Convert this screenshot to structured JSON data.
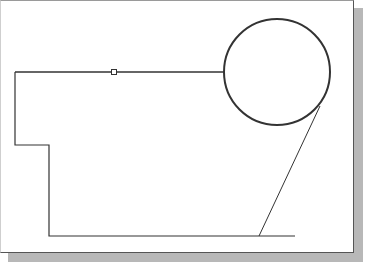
{
  "canvas": {
    "width": 365,
    "height": 262,
    "background": "#ffffff",
    "sheet_border_color": "#555555",
    "shadow_color": "#b8b8b8"
  },
  "sketch": {
    "stroke_color": "#333333",
    "profile_points": [
      [
        15,
        72
      ],
      [
        15,
        145
      ],
      [
        49,
        145
      ],
      [
        49,
        236
      ],
      [
        295,
        236
      ]
    ],
    "top_line": {
      "x1": 15,
      "y1": 72,
      "x2": 224,
      "y2": 72
    },
    "midpoint_marker": {
      "x": 114,
      "y": 72,
      "size": 5
    },
    "circle": {
      "cx": 277,
      "cy": 72,
      "r": 53
    },
    "tangent_line": {
      "x1": 320,
      "y1": 106,
      "x2": 259,
      "y2": 236
    }
  }
}
